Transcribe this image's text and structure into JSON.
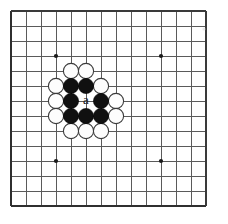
{
  "figure": {
    "kind": "go-board-diagram",
    "background_color": "#ffffff"
  },
  "board": {
    "origin_x": 11,
    "origin_y": 11,
    "cell_size": 15,
    "columns": 14,
    "rows": 14,
    "line_color": "#5a5a5a",
    "border_color": "#3a3a3a",
    "star_point_color": "#1b1b1b",
    "star_point_radius": 2.1,
    "star_points": [
      {
        "col": 4,
        "row": 4
      },
      {
        "col": 11,
        "row": 4
      },
      {
        "col": 4,
        "row": 11
      },
      {
        "col": 11,
        "row": 11
      }
    ]
  },
  "stones": {
    "radius": 7.6,
    "black_color": "#101010",
    "white_color": "#fdfdfd",
    "white_outline_color": "#3b3b3b",
    "black": [
      {
        "col": 5,
        "row": 6
      },
      {
        "col": 6,
        "row": 6
      },
      {
        "col": 5,
        "row": 7
      },
      {
        "col": 7,
        "row": 7
      },
      {
        "col": 5,
        "row": 8
      },
      {
        "col": 6,
        "row": 8
      },
      {
        "col": 7,
        "row": 8
      }
    ],
    "white": [
      {
        "col": 5,
        "row": 5
      },
      {
        "col": 6,
        "row": 5
      },
      {
        "col": 4,
        "row": 6
      },
      {
        "col": 7,
        "row": 6
      },
      {
        "col": 4,
        "row": 7
      },
      {
        "col": 8,
        "row": 7
      },
      {
        "col": 4,
        "row": 8
      },
      {
        "col": 8,
        "row": 8
      },
      {
        "col": 5,
        "row": 9
      },
      {
        "col": 6,
        "row": 9
      },
      {
        "col": 7,
        "row": 9
      }
    ]
  },
  "labels": {
    "point_a": {
      "text": "a",
      "col": 6,
      "row": 7,
      "color": "#141414"
    }
  },
  "artifacts": [
    {
      "x": 204,
      "y": 29,
      "radius": 1.6,
      "color": "#d8d8d8"
    }
  ]
}
